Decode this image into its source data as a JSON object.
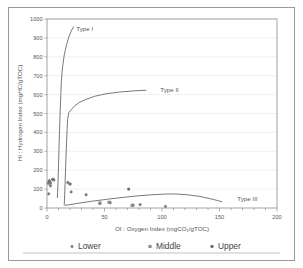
{
  "chart_data": {
    "type": "scatter",
    "title": "",
    "subtitle": "",
    "xlabel": "OI : Oxygen Index (mgCO₂/gTOC)",
    "ylabel": "HI : Hydrogen Index (mgHC/gTOC)",
    "xlim": [
      0,
      200
    ],
    "ylim": [
      0,
      1000
    ],
    "xticks": [
      0,
      50,
      100,
      150,
      200
    ],
    "xtick_labels": [
      "0",
      "50",
      "100",
      "150",
      "200"
    ],
    "x_minor_tick_step": 10,
    "yticks": [
      0,
      100,
      200,
      300,
      400,
      500,
      600,
      700,
      800,
      900,
      1000
    ],
    "ytick_labels": [
      "0",
      "100",
      "200",
      "300",
      "400",
      "500",
      "600",
      "700",
      "800",
      "900",
      "1000"
    ],
    "grid": "horizontal-major-light",
    "legend_position": "bottom",
    "annotations": [
      {
        "text": "Type I",
        "x": 22,
        "y": 945
      },
      {
        "text": "Type II",
        "x": 95,
        "y": 625
      },
      {
        "text": "Type III",
        "x": 162,
        "y": 45
      }
    ],
    "kerogen_paths": [
      {
        "name": "Type I",
        "points": [
          [
            9,
            55
          ],
          [
            9.5,
            120
          ],
          [
            10,
            220
          ],
          [
            10.5,
            330
          ],
          [
            11,
            430
          ],
          [
            11.5,
            520
          ],
          [
            12,
            600
          ],
          [
            12.5,
            670
          ],
          [
            13.5,
            745
          ],
          [
            15,
            810
          ],
          [
            17,
            865
          ],
          [
            19,
            905
          ],
          [
            21,
            935
          ],
          [
            23,
            958
          ]
        ]
      },
      {
        "name": "Type II",
        "points": [
          [
            15,
            15
          ],
          [
            15.5,
            90
          ],
          [
            16,
            180
          ],
          [
            16.5,
            270
          ],
          [
            17,
            350
          ],
          [
            17.5,
            420
          ],
          [
            18,
            470
          ],
          [
            19,
            505
          ],
          [
            21,
            520
          ],
          [
            24,
            540
          ],
          [
            28,
            558
          ],
          [
            34,
            575
          ],
          [
            42,
            592
          ],
          [
            52,
            605
          ],
          [
            64,
            614
          ],
          [
            76,
            620
          ],
          [
            86,
            623
          ]
        ]
      },
      {
        "name": "Type III",
        "points": [
          [
            16,
            14
          ],
          [
            26,
            24
          ],
          [
            38,
            35
          ],
          [
            52,
            46
          ],
          [
            66,
            56
          ],
          [
            80,
            65
          ],
          [
            94,
            71
          ],
          [
            104,
            74
          ],
          [
            112,
            74
          ],
          [
            122,
            70
          ],
          [
            132,
            62
          ],
          [
            140,
            52
          ],
          [
            148,
            40
          ],
          [
            152,
            33
          ]
        ]
      }
    ],
    "series": [
      {
        "name": "Lower",
        "marker": "diamond",
        "color": "#7d7d7d",
        "points": [
          [
            1,
            130
          ],
          [
            2,
            145
          ],
          [
            3,
            118
          ],
          [
            1.5,
            75
          ],
          [
            6,
            148
          ],
          [
            18,
            135
          ],
          [
            21,
            85
          ],
          [
            34,
            70
          ],
          [
            46,
            25
          ],
          [
            55,
            28
          ],
          [
            75,
            15
          ],
          [
            81,
            18
          ],
          [
            103,
            8
          ]
        ]
      },
      {
        "name": "Middle",
        "marker": "square",
        "color": "#8a8a8a",
        "points": [
          [
            2,
            140
          ],
          [
            3,
            132
          ],
          [
            46,
            26
          ],
          [
            54,
            30
          ],
          [
            74,
            14
          ]
        ]
      },
      {
        "name": "Upper",
        "marker": "circle",
        "color": "#6f6f6f",
        "points": [
          [
            2,
            138
          ],
          [
            5,
            152
          ],
          [
            20,
            127
          ],
          [
            71,
            100
          ]
        ]
      }
    ]
  },
  "legend": {
    "items": [
      {
        "label": "Lower",
        "marker": "diamond"
      },
      {
        "label": "Middle",
        "marker": "square"
      },
      {
        "label": "Upper",
        "marker": "circle"
      }
    ]
  }
}
